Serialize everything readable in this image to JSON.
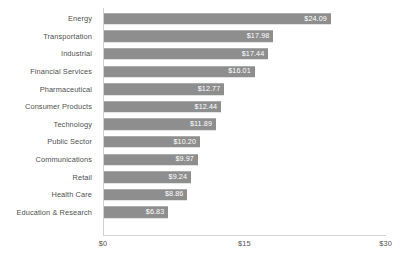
{
  "chart_data": {
    "type": "bar",
    "orientation": "horizontal",
    "title": "",
    "subtitle": "",
    "xlabel": "",
    "ylabel": "",
    "xlim": [
      0,
      30
    ],
    "grid": false,
    "legend": null,
    "bar_color": "#8e8e8e",
    "value_label_color": "#ffffff",
    "axis_label_color": "#4f4f4f",
    "categories": [
      "Energy",
      "Transportation",
      "Industrial",
      "Financial Services",
      "Pharmaceutical",
      "Consumer Products",
      "Technology",
      "Public Sector",
      "Communications",
      "Retail",
      "Health Care",
      "Education & Research"
    ],
    "values": [
      24.09,
      17.98,
      17.44,
      16.01,
      12.77,
      12.44,
      11.89,
      10.2,
      9.97,
      9.24,
      8.86,
      6.83
    ],
    "value_labels": [
      "$24.09",
      "$17.98",
      "$17.44",
      "$16.01",
      "$12.77",
      "$12.44",
      "$11.89",
      "$10.20",
      "$9.97",
      "$9.24",
      "$8.86",
      "$6.83"
    ],
    "xticks": [
      0,
      15,
      30
    ],
    "xtick_labels": [
      "$0",
      "$15",
      "$30"
    ]
  },
  "caption": ""
}
